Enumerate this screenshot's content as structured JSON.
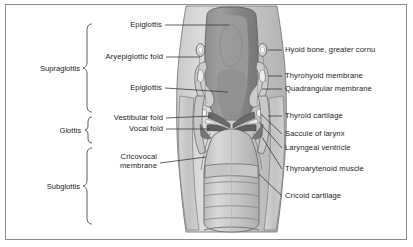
{
  "figure": {
    "background_color": "#ffffff",
    "border_color": "#8d8d8d",
    "illustration_style": "grayscale anatomical drawing"
  },
  "regions": [
    {
      "name": "supraglottis",
      "label": "Supraglottis"
    },
    {
      "name": "glottis",
      "label": "Glottis"
    },
    {
      "name": "subglottis",
      "label": "Subglottis"
    }
  ],
  "left_labels": [
    {
      "name": "epiglottis-upper",
      "label": "Epiglottis"
    },
    {
      "name": "aryepiglottic-fold",
      "label": "Aryepiglottic fold"
    },
    {
      "name": "epiglottis-lower",
      "label": "Epiglottis"
    },
    {
      "name": "vestibular-fold",
      "label": "Vestibular fold"
    },
    {
      "name": "vocal-fold",
      "label": "Vocal fold"
    },
    {
      "name": "cricovocal-membrane",
      "label": "Cricovocal",
      "label2": "membrane"
    }
  ],
  "right_labels": [
    {
      "name": "hyoid-bone-greater-cornu",
      "label": "Hyoid bone, greater cornu"
    },
    {
      "name": "thyrohyoid-membrane",
      "label": "Thyrohyoid membrane"
    },
    {
      "name": "quadrangular-membrane",
      "label": "Quadrangular membrane"
    },
    {
      "name": "thyroid-cartilage",
      "label": "Thyroid cartilage"
    },
    {
      "name": "saccule-of-larynx",
      "label": "Saccule of larynx"
    },
    {
      "name": "laryngeal-ventricle",
      "label": "Laryngeal ventricle"
    },
    {
      "name": "thyroarytenoid-muscle",
      "label": "Thyroarytenoid muscle"
    },
    {
      "name": "cricoid-cartilage",
      "label": "Cricoid cartilage"
    }
  ],
  "palette": {
    "line": "#4a4a4a",
    "text": "#1b1b1b",
    "tissue_light": "#d2d2d2",
    "tissue_mid": "#b0b0b0",
    "tissue_dark": "#8a8a8a",
    "tissue_darkest": "#6f6f6f",
    "cartilage": "#c4c4c4",
    "outline": "#555555"
  }
}
